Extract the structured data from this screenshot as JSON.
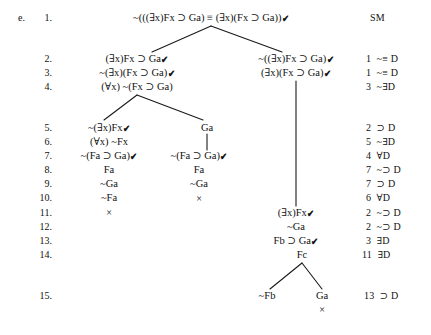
{
  "problem": {
    "label": "e.",
    "type": "truth-tree"
  },
  "line_numbers": [
    "1.",
    "2.",
    "3.",
    "4.",
    "5.",
    "6.",
    "7.",
    "8.",
    "9.",
    "10.",
    "11.",
    "12.",
    "13.",
    "14.",
    "15."
  ],
  "nodes": [
    {
      "id": "n1",
      "line": 1,
      "text": "~(((∃x)Fx ⊃ Ga) ≡ (∃x)(Fx ⊃ Ga))",
      "checked": true,
      "x": 211,
      "y": 18
    },
    {
      "id": "n2L",
      "line": 2,
      "text": "(∃x)Fx ⊃ Ga",
      "checked": true,
      "x": 137,
      "y": 59
    },
    {
      "id": "n3L",
      "line": 3,
      "text": "~(∃x)(Fx ⊃ Ga)",
      "checked": true,
      "x": 137,
      "y": 73
    },
    {
      "id": "n4L",
      "line": 4,
      "text": "(∀x) ~(Fx ⊃ Ga)",
      "checked": false,
      "x": 137,
      "y": 87
    },
    {
      "id": "n2R",
      "line": 2,
      "text": "~((∃x)Fx ⊃ Ga)",
      "checked": true,
      "x": 296,
      "y": 59
    },
    {
      "id": "n3R",
      "line": 3,
      "text": "(∃x)(Fx ⊃ Ga)",
      "checked": true,
      "x": 296,
      "y": 73
    },
    {
      "id": "n5A",
      "line": 5,
      "text": "~(∃x)Fx",
      "checked": true,
      "x": 109,
      "y": 128
    },
    {
      "id": "n6A",
      "line": 6,
      "text": "(∀x) ~Fx",
      "checked": false,
      "x": 109,
      "y": 142
    },
    {
      "id": "n7A",
      "line": 7,
      "text": "~(Fa ⊃ Ga)",
      "checked": true,
      "x": 109,
      "y": 156
    },
    {
      "id": "n8A",
      "line": 8,
      "text": "Fa",
      "checked": false,
      "x": 109,
      "y": 170
    },
    {
      "id": "n9A",
      "line": 9,
      "text": "~Ga",
      "checked": false,
      "x": 109,
      "y": 184
    },
    {
      "id": "n10A",
      "line": 10,
      "text": "~Fa",
      "checked": false,
      "x": 109,
      "y": 198
    },
    {
      "id": "n5B",
      "line": 5,
      "text": "Ga",
      "checked": false,
      "x": 207,
      "y": 128
    },
    {
      "id": "n7B",
      "line": 7,
      "text": "~(Fa ⊃ Ga)",
      "checked": true,
      "x": 199,
      "y": 156
    },
    {
      "id": "n8B",
      "line": 8,
      "text": "Fa",
      "checked": false,
      "x": 199,
      "y": 170
    },
    {
      "id": "n9B",
      "line": 9,
      "text": "~Ga",
      "checked": false,
      "x": 199,
      "y": 184
    },
    {
      "id": "n11R",
      "line": 11,
      "text": "(∃x)Fx",
      "checked": true,
      "x": 296,
      "y": 213
    },
    {
      "id": "n12R",
      "line": 12,
      "text": "~Ga",
      "checked": false,
      "x": 296,
      "y": 227
    },
    {
      "id": "n13R",
      "line": 13,
      "text": "Fb ⊃ Ga",
      "checked": true,
      "x": 296,
      "y": 241
    },
    {
      "id": "n14R",
      "line": 14,
      "text": "Fc",
      "checked": false,
      "x": 302,
      "y": 255
    },
    {
      "id": "n15L",
      "line": 15,
      "text": "~Fb",
      "checked": false,
      "x": 267,
      "y": 296
    },
    {
      "id": "n15R",
      "line": 15,
      "text": "Ga",
      "checked": false,
      "x": 322,
      "y": 296
    }
  ],
  "closures": [
    {
      "id": "x10B",
      "x": 199,
      "y": 199
    },
    {
      "id": "x11A",
      "x": 109,
      "y": 213
    },
    {
      "id": "x15R",
      "x": 322,
      "y": 310
    }
  ],
  "justifications": [
    {
      "line": 1,
      "ref": "",
      "rule": "SM",
      "x": 370,
      "y": 18
    },
    {
      "line": 2,
      "ref": "1",
      "rule": "~≡ D",
      "x": 366,
      "y": 59
    },
    {
      "line": 3,
      "ref": "1",
      "rule": "~≡ D",
      "x": 366,
      "y": 73
    },
    {
      "line": 4,
      "ref": "3",
      "rule": "~∃D",
      "x": 366,
      "y": 87
    },
    {
      "line": 5,
      "ref": "2",
      "rule": "⊃ D",
      "x": 366,
      "y": 128
    },
    {
      "line": 6,
      "ref": "5",
      "rule": "~∃D",
      "x": 366,
      "y": 142
    },
    {
      "line": 7,
      "ref": "4",
      "rule": "∀D",
      "x": 366,
      "y": 156
    },
    {
      "line": 8,
      "ref": "7",
      "rule": "~⊃ D",
      "x": 366,
      "y": 170
    },
    {
      "line": 9,
      "ref": "7",
      "rule": "⊃ D",
      "x": 366,
      "y": 184
    },
    {
      "line": 10,
      "ref": "6",
      "rule": "∀D",
      "x": 366,
      "y": 198
    },
    {
      "line": 11,
      "ref": "2",
      "rule": "~⊃ D",
      "x": 366,
      "y": 213
    },
    {
      "line": 12,
      "ref": "2",
      "rule": "~⊃ D",
      "x": 366,
      "y": 227
    },
    {
      "line": 13,
      "ref": "3",
      "rule": "∃D",
      "x": 366,
      "y": 241
    },
    {
      "line": 14,
      "ref": "11",
      "rule": "∃D",
      "x": 362,
      "y": 255
    },
    {
      "line": 15,
      "ref": "13",
      "rule": "⊃ D",
      "x": 364,
      "y": 296
    }
  ],
  "line_number_positions": [
    {
      "label": "1.",
      "y": 18
    },
    {
      "label": "2.",
      "y": 59
    },
    {
      "label": "3.",
      "y": 73
    },
    {
      "label": "4.",
      "y": 87
    },
    {
      "label": "5.",
      "y": 128
    },
    {
      "label": "6.",
      "y": 142
    },
    {
      "label": "7.",
      "y": 156
    },
    {
      "label": "8.",
      "y": 170
    },
    {
      "label": "9.",
      "y": 184
    },
    {
      "label": "10.",
      "y": 198
    },
    {
      "label": "11.",
      "y": 213
    },
    {
      "label": "12.",
      "y": 227
    },
    {
      "label": "13.",
      "y": 241
    },
    {
      "label": "14.",
      "y": 255
    },
    {
      "label": "15.",
      "y": 296
    }
  ],
  "check_glyph": "✔",
  "close_glyph": "×",
  "colors": {
    "ink": "#111111",
    "paper": "#ffffff",
    "rule_line": "#1a1a1a"
  }
}
